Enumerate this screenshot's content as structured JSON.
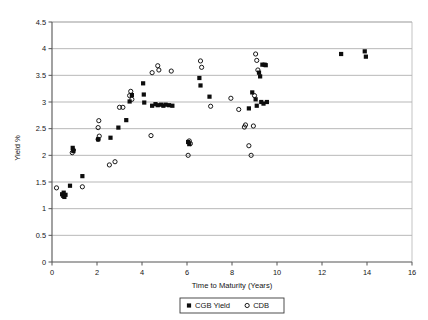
{
  "chart_data": {
    "type": "scatter",
    "title": "",
    "xlabel": "Time to Maturity (Years)",
    "ylabel": "Yield %",
    "xlim": [
      0,
      16
    ],
    "ylim": [
      0,
      4.5
    ],
    "xticks": [
      0,
      2,
      4,
      6,
      8,
      10,
      12,
      14,
      16
    ],
    "xtick_labels": [
      "0",
      "2",
      "4",
      "6",
      "8",
      "10",
      "12",
      "14",
      "16"
    ],
    "yticks": [
      0,
      0.5,
      1,
      1.5,
      2,
      2.5,
      3,
      3.5,
      4,
      4.5
    ],
    "ytick_labels": [
      "0",
      "0.5",
      "1",
      "1.5",
      "2",
      "2.5",
      "3",
      "3.5",
      "4",
      "4.5"
    ],
    "grid": "horizontal",
    "legend_position": "bottom-center",
    "series": [
      {
        "name": "CGB Yield",
        "marker": "filled-square",
        "color": "#0d0d0d",
        "points": [
          [
            0.45,
            1.27
          ],
          [
            0.5,
            1.24
          ],
          [
            0.55,
            1.22
          ],
          [
            0.6,
            1.26
          ],
          [
            0.52,
            1.3
          ],
          [
            0.8,
            1.43
          ],
          [
            0.92,
            2.14
          ],
          [
            0.95,
            2.08
          ],
          [
            1.35,
            1.61
          ],
          [
            2.05,
            2.3
          ],
          [
            2.6,
            2.33
          ],
          [
            2.95,
            2.52
          ],
          [
            3.3,
            2.66
          ],
          [
            3.45,
            3.01
          ],
          [
            3.55,
            3.13
          ],
          [
            4.05,
            3.35
          ],
          [
            4.08,
            3.14
          ],
          [
            4.1,
            2.99
          ],
          [
            4.45,
            2.93
          ],
          [
            4.6,
            2.96
          ],
          [
            4.7,
            2.94
          ],
          [
            4.85,
            2.95
          ],
          [
            4.95,
            2.93
          ],
          [
            5.05,
            2.95
          ],
          [
            5.2,
            2.94
          ],
          [
            5.35,
            2.93
          ],
          [
            6.05,
            2.25
          ],
          [
            6.1,
            2.21
          ],
          [
            6.55,
            3.45
          ],
          [
            6.6,
            3.31
          ],
          [
            7.0,
            3.1
          ],
          [
            8.75,
            2.88
          ],
          [
            9.05,
            3.05
          ],
          [
            9.1,
            2.93
          ],
          [
            9.3,
            3.0
          ],
          [
            9.4,
            2.97
          ],
          [
            9.55,
            3.0
          ],
          [
            9.2,
            3.55
          ],
          [
            9.25,
            3.48
          ],
          [
            9.35,
            3.7
          ],
          [
            9.45,
            3.7
          ],
          [
            9.5,
            3.69
          ],
          [
            8.9,
            3.18
          ],
          [
            12.85,
            3.9
          ],
          [
            13.9,
            3.95
          ],
          [
            13.95,
            3.85
          ]
        ]
      },
      {
        "name": "CDB",
        "marker": "open-circle",
        "color": "#0d0d0d",
        "points": [
          [
            0.2,
            1.39
          ],
          [
            0.9,
            2.05
          ],
          [
            0.95,
            2.1
          ],
          [
            1.35,
            1.41
          ],
          [
            2.05,
            2.3
          ],
          [
            2.1,
            2.36
          ],
          [
            2.05,
            2.52
          ],
          [
            2.08,
            2.65
          ],
          [
            2.55,
            1.82
          ],
          [
            2.8,
            1.88
          ],
          [
            3.0,
            2.9
          ],
          [
            3.15,
            2.9
          ],
          [
            3.45,
            3.12
          ],
          [
            3.5,
            3.2
          ],
          [
            3.55,
            3.05
          ],
          [
            4.4,
            2.37
          ],
          [
            4.7,
            3.68
          ],
          [
            4.75,
            3.6
          ],
          [
            4.45,
            3.55
          ],
          [
            5.3,
            3.58
          ],
          [
            6.05,
            2.0
          ],
          [
            6.1,
            2.27
          ],
          [
            6.15,
            2.22
          ],
          [
            6.6,
            3.77
          ],
          [
            6.65,
            3.65
          ],
          [
            7.05,
            2.92
          ],
          [
            8.3,
            2.86
          ],
          [
            8.55,
            2.53
          ],
          [
            8.6,
            2.57
          ],
          [
            8.95,
            2.55
          ],
          [
            8.85,
            2.0
          ],
          [
            8.75,
            2.18
          ],
          [
            9.05,
            3.9
          ],
          [
            9.1,
            3.78
          ],
          [
            9.15,
            3.6
          ],
          [
            9.0,
            3.12
          ],
          [
            7.95,
            3.07
          ]
        ]
      }
    ]
  },
  "axes": {
    "y_axis_title": "Yield %",
    "x_axis_title": "Time to Maturity (Years)"
  },
  "legend": {
    "entries": [
      {
        "label": "CGB Yield",
        "marker": "filled-square"
      },
      {
        "label": "CDB",
        "marker": "open-circle"
      }
    ]
  }
}
